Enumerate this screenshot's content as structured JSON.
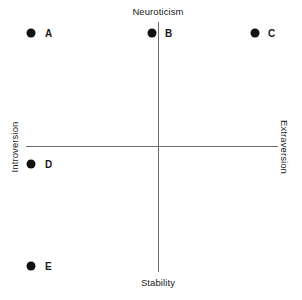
{
  "chart_data": {
    "type": "scatter",
    "title": "",
    "subtitle": "",
    "xlabel": "",
    "ylabel": "",
    "xlim": [
      -1,
      1
    ],
    "ylim": [
      -1,
      1
    ],
    "grid": false,
    "legend": null,
    "axis_labels": {
      "top": "Neuroticism",
      "bottom": "Stability",
      "left": "Introversion",
      "right": "Extraversion"
    },
    "points": [
      {
        "label": "A",
        "x": -0.95,
        "y": 0.91,
        "px": 31,
        "py": 33,
        "label_px": 45,
        "label_py": 33
      },
      {
        "label": "B",
        "x": -0.04,
        "y": 0.91,
        "px": 152,
        "py": 33,
        "label_px": 165,
        "label_py": 33
      },
      {
        "label": "C",
        "x": 0.8,
        "y": 0.91,
        "px": 255,
        "py": 33,
        "label_px": 268,
        "label_py": 33
      },
      {
        "label": "D",
        "x": -0.95,
        "y": -0.14,
        "px": 31,
        "py": 164,
        "label_px": 45,
        "label_py": 164
      },
      {
        "label": "E",
        "x": -0.95,
        "y": -0.88,
        "px": 31,
        "py": 266,
        "label_px": 45,
        "label_py": 266
      }
    ],
    "colors": {
      "point": "#111111",
      "axis": "#6d6d6d",
      "text": "#1a1a1a",
      "background": "#ffffff"
    }
  }
}
